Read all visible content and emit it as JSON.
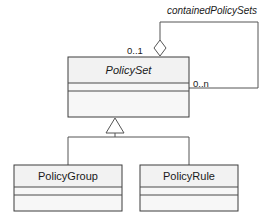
{
  "diagram": {
    "kind": "uml-class-diagram",
    "background_color": "#ffffff",
    "line_color": "#555555",
    "box_border_color": "#3d3d3d",
    "box_fill_color": "#f2f2f2",
    "text_color": "#1a1a1a"
  },
  "classes": [
    {
      "id": "policyset",
      "name": "PolicySet",
      "abstract": true,
      "italic": true,
      "x": 68,
      "y": 57,
      "width": 121,
      "height": 60,
      "header_height": 26,
      "attr_height": 8
    },
    {
      "id": "policygroup",
      "name": "PolicyGroup",
      "abstract": false,
      "italic": false,
      "x": 14,
      "y": 165,
      "width": 108,
      "height": 46,
      "header_height": 22,
      "attr_height": 8
    },
    {
      "id": "policyrule",
      "name": "PolicyRule",
      "abstract": false,
      "italic": false,
      "x": 140,
      "y": 165,
      "width": 98,
      "height": 46,
      "header_height": 22,
      "attr_height": 8
    }
  ],
  "associations": [
    {
      "id": "contained-policy-sets",
      "label": "containedPolicySets",
      "label_italic": true,
      "label_x": 212,
      "label_y": 14,
      "source_role": "aggregate",
      "source_multiplicity": "0..1",
      "source_multiplicity_x": 142,
      "source_multiplicity_y": 51,
      "target_multiplicity": "0..n",
      "target_multiplicity_x": 193,
      "target_multiplicity_y": 84,
      "marker": "hollow-diamond",
      "marker_x": 160,
      "marker_y": 48,
      "path": "M 160 46 L 160 22 L 258 22 L 258 88 L 189 88"
    }
  ],
  "generalizations": [
    {
      "id": "policyset-generalization",
      "marker": "hollow-triangle",
      "parent": "PolicySet",
      "children": [
        "PolicyGroup",
        "PolicyRule"
      ],
      "apex_x": 115,
      "apex_y": 122,
      "trunk_y": 137,
      "branch_left_x": 68,
      "branch_right_x": 189
    }
  ],
  "labels": {
    "contained_policy_sets": "containedPolicySets",
    "mult_zero_one": "0..1",
    "mult_zero_n": "0..n",
    "class_policyset": "PolicySet",
    "class_policygroup": "PolicyGroup",
    "class_policyrule": "PolicyRule"
  }
}
